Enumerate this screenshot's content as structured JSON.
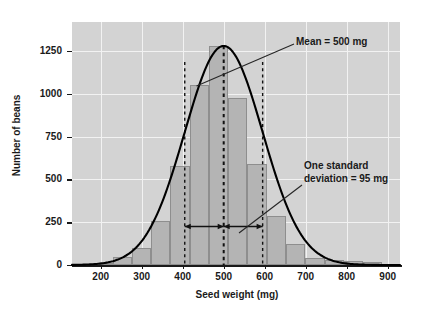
{
  "chart_data": {
    "type": "bar",
    "title": "",
    "subtitle": "",
    "xlabel": "Seed weight (mg)",
    "ylabel": "Number of beans",
    "xlim": [
      130,
      930
    ],
    "ylim": [
      0,
      1420
    ],
    "grid": true,
    "legend": "none",
    "xticks": [
      200,
      300,
      400,
      500,
      600,
      700,
      800,
      900
    ],
    "xtick_labels": [
      "200",
      "300",
      "400",
      "500",
      "600",
      "700",
      "800",
      "900"
    ],
    "yticks": [
      0,
      250,
      500,
      750,
      1000,
      1250
    ],
    "ytick_labels": [
      "0",
      "250",
      "500",
      "750",
      "1000",
      "1250"
    ],
    "bin_width": 47,
    "bin_edges": [
      135,
      182,
      229,
      276,
      323,
      370,
      417,
      464,
      511,
      558,
      605,
      652,
      699,
      746,
      793,
      840,
      887,
      930
    ],
    "categories": [
      "135-182",
      "182-229",
      "229-276",
      "276-323",
      "323-370",
      "370-417",
      "417-464",
      "464-511",
      "511-558",
      "558-605",
      "605-652",
      "652-699",
      "699-746",
      "746-793",
      "793-840",
      "840-887",
      "887-930"
    ],
    "values": [
      5,
      12,
      45,
      100,
      258,
      580,
      1050,
      1280,
      975,
      590,
      285,
      120,
      40,
      28,
      25,
      18,
      6
    ],
    "series": [
      {
        "name": "Number of beans",
        "values": [
          5,
          12,
          45,
          100,
          258,
          580,
          1050,
          1280,
          975,
          590,
          285,
          120,
          40,
          28,
          25,
          18,
          6
        ]
      }
    ],
    "curve": {
      "name": "normal distribution fit",
      "mean": 500,
      "sd": 95,
      "peak": 1280,
      "color": "#000000"
    },
    "annotations": [
      {
        "name": "mean",
        "text": "Mean = 500 mg",
        "value": 500,
        "unit": "mg"
      },
      {
        "name": "standard-deviation",
        "text": "One standard\ndeviation = 95 mg",
        "value": 95,
        "unit": "mg"
      }
    ],
    "reference_lines": [
      {
        "name": "minus-one-sd",
        "x": 405,
        "style": "dashed"
      },
      {
        "name": "mean",
        "x": 500,
        "style": "dashed"
      },
      {
        "name": "plus-one-sd",
        "x": 595,
        "style": "dashed"
      }
    ],
    "sd_span": {
      "from": 405,
      "to": 595,
      "at_y": 225
    },
    "colors": {
      "plot_background": "#d3d3d3",
      "gridline": "#f2f2f2",
      "bar_fill": "#b4b4b4",
      "bar_stroke": "#8e8e8e",
      "curve": "#000000",
      "text": "#1a1a1a",
      "page_background": "#ffffff"
    }
  }
}
